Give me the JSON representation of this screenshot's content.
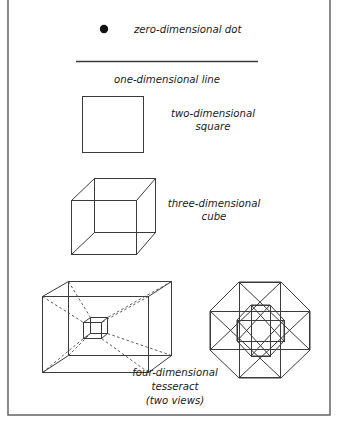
{
  "figure": {
    "background_color": "#ffffff",
    "ink_color": "#3a3a3a",
    "frame_color": "#6d6d6d",
    "text_color": "#1b1b1b"
  },
  "rows": [
    {
      "id": "zero-d",
      "glyph": "filled-dot",
      "caption_lines": [
        "zero-dimensional dot"
      ],
      "caption_align": "left"
    },
    {
      "id": "one-d",
      "glyph": "horizontal-line",
      "caption_lines": [
        "one-dimensional line"
      ],
      "caption_align": "center"
    },
    {
      "id": "two-d",
      "glyph": "square",
      "caption_lines": [
        "two-dimensional",
        "square"
      ],
      "caption_align": "center"
    },
    {
      "id": "three-d",
      "glyph": "cube",
      "caption_lines": [
        "three-dimensional",
        "cube"
      ],
      "caption_align": "center"
    },
    {
      "id": "four-d",
      "glyph": "tesseract",
      "caption_lines": [
        "four-dimensional",
        "tesseract",
        "(two views)"
      ],
      "caption_align": "center"
    }
  ],
  "captions": {
    "zero_dimensional_dot": "zero-dimensional dot",
    "one_dimensional_line": "one-dimensional line",
    "two_dimensional_1": "two-dimensional",
    "two_dimensional_2": "square",
    "three_dimensional_1": "three-dimensional",
    "three_dimensional_2": "cube",
    "four_dimensional_1": "four-dimensional",
    "four_dimensional_2": "tesseract",
    "four_dimensional_3": "(two views)"
  }
}
